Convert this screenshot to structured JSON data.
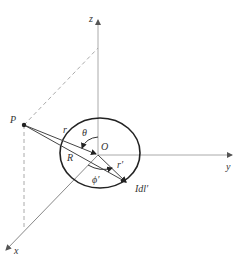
{
  "top_fragment": "",
  "diagram": {
    "labels": {
      "z_axis": "z",
      "y_axis": "y",
      "x_axis": "x",
      "point_P": "P",
      "origin": "O",
      "r": "r",
      "R": "R",
      "r_prime": "r′",
      "theta": "θ",
      "phi_prime": "ϕ′",
      "current_element": "Idl′"
    },
    "colors": {
      "axis": "#999999",
      "loop": "#222222",
      "vector": "#444444",
      "dashed": "#999999",
      "text": "#333333"
    }
  }
}
